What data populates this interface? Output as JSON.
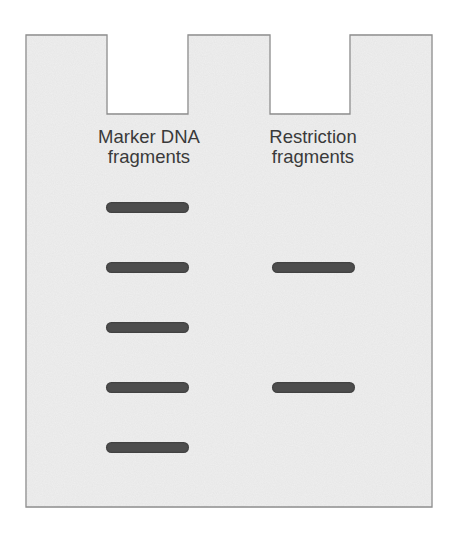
{
  "diagram": {
    "colors": {
      "gel_fill": "#efefef",
      "gel_outline": "#8a8a8a",
      "band": "#4d4d4d",
      "label_text": "#3a3a3a",
      "background": "#ffffff"
    },
    "lanes": [
      {
        "label_line1": "Marker DNA",
        "label_line2": "fragments",
        "band_count": 5,
        "bands_y": [
          207,
          267,
          327,
          387,
          447
        ]
      },
      {
        "label_line1": "Restriction",
        "label_line2": "fragments",
        "band_count": 2,
        "bands_y": [
          267,
          387
        ]
      }
    ]
  }
}
